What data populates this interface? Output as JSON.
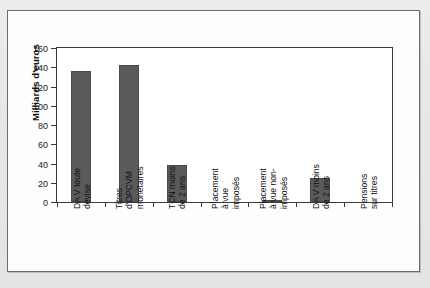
{
  "figure": {
    "y_axis_title": "Milliards d'euros"
  },
  "chart_data": {
    "type": "bar",
    "title": "",
    "xlabel": "",
    "ylabel": "Milliards d'euros",
    "ylim": [
      0,
      160
    ],
    "yticks": [
      0,
      20,
      40,
      60,
      80,
      100,
      120,
      140,
      160
    ],
    "ytick_labels": [
      "0",
      "20",
      "40",
      "60",
      "80",
      "100",
      "120",
      "140",
      "160"
    ],
    "grid": false,
    "legend": null,
    "bar_color": "#5a5a5a",
    "categories": [
      "DA V toute devise",
      "Titres d'OPCVM monétaires",
      "TCN moins de 2 ans",
      "Placement à vue imposés",
      "Placement à vue non-imposés",
      "DA V moins de 2 ans",
      "Pensions sur titres"
    ],
    "category_lines": [
      [
        "DA V toute",
        "devise"
      ],
      [
        "Titres",
        "d'OPCVM",
        "monétaires"
      ],
      [
        "TCN moins",
        "de 2 ans"
      ],
      [
        "Placement",
        "à vue",
        "imposés"
      ],
      [
        "Placement",
        "à vue non-",
        "imposés"
      ],
      [
        "DA V moins",
        "de 2 ans"
      ],
      [
        "Pensions",
        "sur titres"
      ]
    ],
    "values": [
      136,
      142,
      38,
      0,
      2.5,
      25,
      0
    ]
  }
}
